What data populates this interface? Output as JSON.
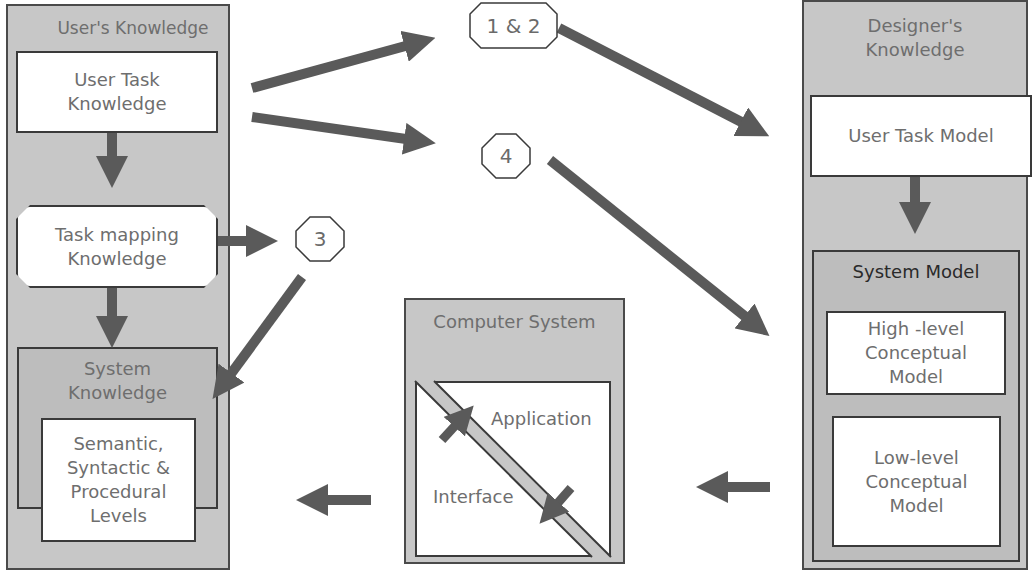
{
  "diagram": {
    "colors": {
      "panel_fill": "#c7c7c7",
      "inner_fill": "#bdbdbd",
      "box_fill": "#ffffff",
      "arrow": "#5a5a5a",
      "text": "#6e6e6e",
      "border": "#3a3a3a"
    },
    "user_panel": {
      "title": "User's Knowledge",
      "user_task": "User Task\nKnowledge",
      "task_mapping": "Task mapping\nKnowledge",
      "system_knowledge": "System\nKnowledge",
      "levels": "Semantic,\nSyntactic &\nProcedural\nLevels"
    },
    "designer_panel": {
      "title": "Designer's\nKnowledge",
      "user_task_model": "User Task Model",
      "system_model": "System Model",
      "high_level": "High -level\nConceptual\nModel",
      "low_level": "Low-level\nConceptual\nModel"
    },
    "computer_panel": {
      "title": "Computer System",
      "application": "Application",
      "interface": "Interface"
    },
    "tags": {
      "t12": "1 & 2",
      "t3": "3",
      "t4": "4"
    }
  }
}
